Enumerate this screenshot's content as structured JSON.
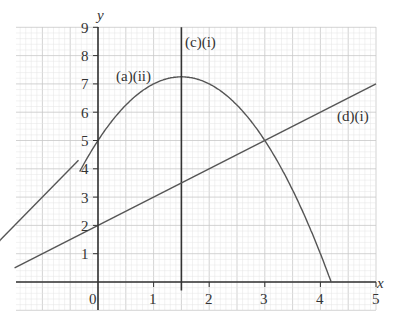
{
  "chart_data": {
    "type": "line",
    "title": "",
    "xlabel": "x",
    "ylabel": "y",
    "xlim": [
      -1.5,
      5
    ],
    "ylim": [
      -0.5,
      9
    ],
    "grid": true,
    "x_ticks": [
      "0",
      "1",
      "2",
      "3",
      "4",
      "5"
    ],
    "y_ticks": [
      "1",
      "2",
      "3",
      "4",
      "5",
      "6",
      "7",
      "8",
      "9"
    ],
    "series": [
      {
        "name": "(a)(ii)",
        "kind": "curve",
        "equation": "y = 5 + 3x - x^2",
        "x": [
          -0.3,
          0,
          0.5,
          1,
          1.5,
          2,
          2.5,
          3,
          3.5,
          4,
          4.19
        ],
        "y": [
          3.98,
          5,
          6.25,
          7,
          7.25,
          7,
          6.25,
          5,
          3.75,
          1,
          0
        ]
      },
      {
        "name": "(c)(i)",
        "kind": "vertical line",
        "equation": "x = 1.5",
        "x": [
          1.5,
          1.5
        ],
        "y": [
          -0.3,
          9
        ]
      },
      {
        "name": "(d)(i)",
        "kind": "line",
        "equation": "y = x + 2",
        "x": [
          -1.5,
          5
        ],
        "y": [
          0.5,
          7
        ]
      },
      {
        "name": "",
        "kind": "line",
        "equation": "y = 2x + 5",
        "x": [
          -2.85,
          -0.35
        ],
        "y": [
          -0.7,
          4.3
        ]
      }
    ],
    "annotations": [
      "(a)(ii)",
      "(c)(i)",
      "(d)(i)"
    ]
  },
  "labels": {
    "x_axis": "x",
    "y_axis": "y",
    "origin": "0",
    "curve": "(a)(ii)",
    "vline": "(c)(i)",
    "line": "(d)(i)",
    "xt": [
      "1",
      "2",
      "3",
      "4",
      "5"
    ],
    "yt": [
      "1",
      "2",
      "3",
      "4",
      "5",
      "6",
      "7",
      "8",
      "9"
    ]
  },
  "colors": {
    "grid_minor": "#e4e4e4",
    "grid_major": "#c8c8c8",
    "axis": "#333333",
    "curve": "#555555"
  }
}
